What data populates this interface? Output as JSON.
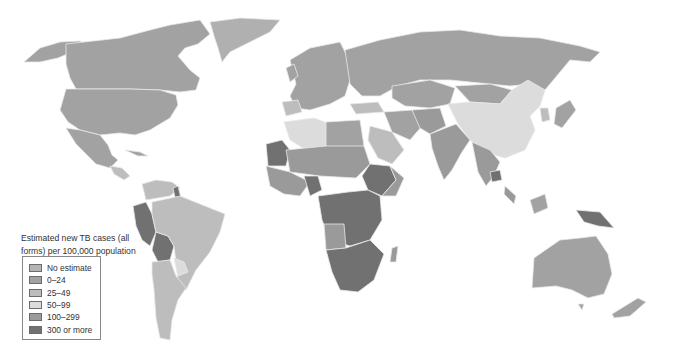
{
  "map": {
    "title": "Estimated new TB cases (all forms) per 100,000 population",
    "legend": {
      "title_line1": "Estimated new TB cases (all",
      "title_line2": "forms) per 100,000 population",
      "items": [
        {
          "label": "No estimate",
          "color": "#b4b4b4"
        },
        {
          "label": "0–24",
          "color": "#a2a2a2"
        },
        {
          "label": "25–49",
          "color": "#bdbdbd"
        },
        {
          "label": "50–99",
          "color": "#dcdcdc"
        },
        {
          "label": "100–299",
          "color": "#9a9a9a"
        },
        {
          "label": "300 or more",
          "color": "#717171"
        }
      ]
    },
    "colors": {
      "no_estimate": "#b4b4b4",
      "c0_24": "#a2a2a2",
      "c25_49": "#bdbdbd",
      "c50_99": "#dcdcdc",
      "c100_299": "#9a9a9a",
      "c300_plus": "#717171",
      "border": "#e6e6e6",
      "ocean": "#ffffff"
    }
  }
}
